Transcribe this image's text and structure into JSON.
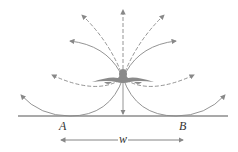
{
  "diagram": {
    "labels": {
      "point_a": "A",
      "point_b": "B",
      "width": "w"
    },
    "colors": {
      "line": "#888888",
      "ground": "#555555",
      "craft": "#8a8a8a",
      "text": "#333333"
    }
  }
}
